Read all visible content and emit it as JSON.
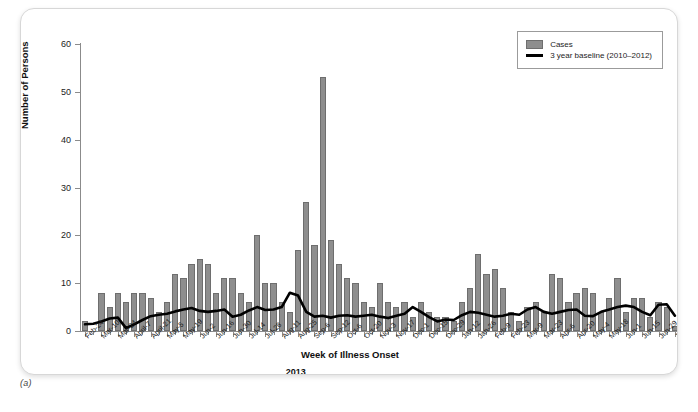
{
  "figure": {
    "caption": "(a)"
  },
  "chart_data": {
    "type": "bar",
    "title": "",
    "xlabel": "Week of Illness Onset",
    "ylabel": "Number of Persons",
    "ylim": [
      0,
      60
    ],
    "yticks": [
      0,
      10,
      20,
      30,
      40,
      50,
      60
    ],
    "grid": false,
    "legend_position": "top-right",
    "year_markers": [
      {
        "label": "2013",
        "index": 25
      },
      {
        "label": "2014",
        "index": 91
      }
    ],
    "tick_labels": [
      {
        "index": 0,
        "label": "Feb-24"
      },
      {
        "index": 2,
        "label": "Mar-10"
      },
      {
        "index": 4,
        "label": "Mar-24"
      },
      {
        "index": 6,
        "label": "April-7"
      },
      {
        "index": 8,
        "label": "April-21"
      },
      {
        "index": 10,
        "label": "May-5"
      },
      {
        "index": 12,
        "label": "May-19"
      },
      {
        "index": 14,
        "label": "Jun-2"
      },
      {
        "index": 16,
        "label": "Jun-16"
      },
      {
        "index": 18,
        "label": "Jun-30"
      },
      {
        "index": 20,
        "label": "Jul-14"
      },
      {
        "index": 22,
        "label": "Jul-28"
      },
      {
        "index": 24,
        "label": "Aug-11"
      },
      {
        "index": 26,
        "label": "Aug-25"
      },
      {
        "index": 28,
        "label": "Sep-6"
      },
      {
        "index": 30,
        "label": "Sep-12"
      },
      {
        "index": 32,
        "label": "Oct-6"
      },
      {
        "index": 34,
        "label": "Oct-20"
      },
      {
        "index": 36,
        "label": "Nov-3"
      },
      {
        "index": 38,
        "label": "Nov-17"
      },
      {
        "index": 40,
        "label": "Dec-1"
      },
      {
        "index": 42,
        "label": "Dec-15"
      },
      {
        "index": 44,
        "label": "Dec-29"
      },
      {
        "index": 46,
        "label": "Jan-12"
      },
      {
        "index": 48,
        "label": "Jan-26"
      },
      {
        "index": 50,
        "label": "Feb-9"
      },
      {
        "index": 52,
        "label": "Feb-23"
      },
      {
        "index": 54,
        "label": "Mar-9"
      },
      {
        "index": 56,
        "label": "Mar-23"
      },
      {
        "index": 58,
        "label": "Apr-6"
      },
      {
        "index": 60,
        "label": "Apr-20"
      },
      {
        "index": 62,
        "label": "May-4"
      },
      {
        "index": 64,
        "label": "May-18"
      },
      {
        "index": 66,
        "label": "Jun-1"
      },
      {
        "index": 68,
        "label": "Jun-15"
      },
      {
        "index": 70,
        "label": "Jun-29"
      },
      {
        "index": 72,
        "label": "Jul-13"
      }
    ],
    "series": [
      {
        "name": "Cases",
        "kind": "bar",
        "color": "#8e8e8e",
        "values": [
          2,
          0,
          8,
          5,
          8,
          6,
          8,
          8,
          7,
          4,
          6,
          12,
          11,
          14,
          15,
          14,
          8,
          11,
          11,
          8,
          6,
          20,
          10,
          10,
          6,
          4,
          17,
          27,
          18,
          53,
          19,
          14,
          11,
          10,
          6,
          5,
          10,
          6,
          5,
          6,
          3,
          6,
          4,
          3,
          3,
          2,
          6,
          9,
          16,
          12,
          13,
          9,
          4,
          2,
          5,
          6,
          4,
          12,
          11,
          6,
          8,
          9,
          8,
          4,
          7,
          11,
          4,
          7,
          7,
          3,
          6,
          5,
          1
        ]
      },
      {
        "name": "3 year baseline (2010–2012)",
        "kind": "line",
        "color": "#000000",
        "values": [
          1.4,
          1.5,
          2.0,
          2.6,
          2.8,
          0.6,
          1.4,
          2.3,
          3.1,
          3.4,
          3.6,
          4.1,
          4.5,
          4.8,
          4.2,
          4.0,
          4.2,
          4.5,
          3.0,
          3.4,
          4.3,
          5.0,
          4.4,
          4.5,
          5.0,
          8.0,
          7.4,
          4.0,
          3.0,
          3.2,
          2.8,
          3.2,
          3.3,
          3.0,
          3.2,
          3.4,
          3.0,
          2.7,
          3.2,
          3.6,
          5.0,
          4.0,
          2.9,
          2.0,
          2.4,
          2.3,
          3.3,
          4.0,
          3.8,
          3.4,
          3.0,
          3.2,
          3.6,
          3.4,
          4.5,
          5.0,
          4.0,
          3.6,
          4.0,
          4.4,
          4.5,
          3.2,
          3.1,
          4.0,
          4.5,
          5.0,
          5.3,
          5.0,
          4.0,
          3.3,
          5.5,
          5.6,
          3.2
        ]
      }
    ]
  },
  "legend": {
    "items": [
      {
        "label": "Cases",
        "marker": "bar-swatch"
      },
      {
        "label": "3 year baseline (2010–2012)",
        "marker": "line-swatch"
      }
    ]
  }
}
